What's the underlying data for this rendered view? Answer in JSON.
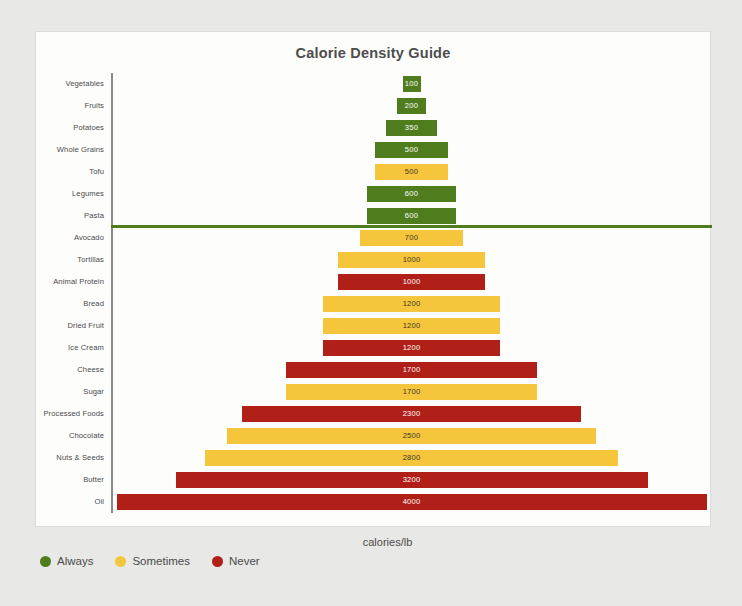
{
  "card": {
    "title": "Calorie Density Guide"
  },
  "legend": {
    "items": [
      {
        "label": "Always",
        "color": "#4f7d1e"
      },
      {
        "label": "Sometimes",
        "color": "#f5c63c"
      },
      {
        "label": "Never",
        "color": "#b01f18"
      }
    ]
  },
  "chart_data": {
    "type": "bar",
    "orientation": "horizontal-centered-funnel",
    "title": "Calorie Density Guide",
    "xlabel": "calories/lb",
    "ylabel": "",
    "xlim": [
      0,
      4000
    ],
    "grid": false,
    "legend_position": "bottom-left",
    "divider_after_category": "Pasta",
    "divider_color": "#4f7d1e",
    "categories": [
      "Vegetables",
      "Fruits",
      "Potatoes",
      "Whole Grains",
      "Tofu",
      "Legumes",
      "Pasta",
      "Avocado",
      "Tortillas",
      "Animal Protein",
      "Bread",
      "Dried Fruit",
      "Ice Cream",
      "Cheese",
      "Sugar",
      "Processed Foods",
      "Chocolate",
      "Nuts & Seeds",
      "Butter",
      "Oil"
    ],
    "values": [
      100,
      200,
      350,
      500,
      500,
      600,
      600,
      700,
      1000,
      1000,
      1200,
      1200,
      1200,
      1700,
      1700,
      2300,
      2500,
      2800,
      3200,
      4000
    ],
    "groups": [
      "Always",
      "Always",
      "Always",
      "Always",
      "Sometimes",
      "Always",
      "Always",
      "Sometimes",
      "Sometimes",
      "Never",
      "Sometimes",
      "Sometimes",
      "Never",
      "Never",
      "Sometimes",
      "Never",
      "Sometimes",
      "Sometimes",
      "Never",
      "Never"
    ],
    "colors": {
      "Always": "#4f7d1e",
      "Sometimes": "#f5c63c",
      "Never": "#b01f18"
    },
    "rows": [
      {
        "label": "Vegetables",
        "value": 100,
        "value_text": "100",
        "group": "Always"
      },
      {
        "label": "Fruits",
        "value": 200,
        "value_text": "200",
        "group": "Always"
      },
      {
        "label": "Potatoes",
        "value": 350,
        "value_text": "350",
        "group": "Always"
      },
      {
        "label": "Whole Grains",
        "value": 500,
        "value_text": "500",
        "group": "Always"
      },
      {
        "label": "Tofu",
        "value": 500,
        "value_text": "500",
        "group": "Sometimes"
      },
      {
        "label": "Legumes",
        "value": 600,
        "value_text": "600",
        "group": "Always"
      },
      {
        "label": "Pasta",
        "value": 600,
        "value_text": "600",
        "group": "Always"
      },
      {
        "label": "Avocado",
        "value": 700,
        "value_text": "700",
        "group": "Sometimes"
      },
      {
        "label": "Tortillas",
        "value": 1000,
        "value_text": "1000",
        "group": "Sometimes"
      },
      {
        "label": "Animal Protein",
        "value": 1000,
        "value_text": "1000",
        "group": "Never"
      },
      {
        "label": "Bread",
        "value": 1200,
        "value_text": "1200",
        "group": "Sometimes"
      },
      {
        "label": "Dried Fruit",
        "value": 1200,
        "value_text": "1200",
        "group": "Sometimes"
      },
      {
        "label": "Ice Cream",
        "value": 1200,
        "value_text": "1200",
        "group": "Never"
      },
      {
        "label": "Cheese",
        "value": 1700,
        "value_text": "1700",
        "group": "Never"
      },
      {
        "label": "Sugar",
        "value": 1700,
        "value_text": "1700",
        "group": "Sometimes"
      },
      {
        "label": "Processed Foods",
        "value": 2300,
        "value_text": "2300",
        "group": "Never"
      },
      {
        "label": "Chocolate",
        "value": 2500,
        "value_text": "2500",
        "group": "Sometimes"
      },
      {
        "label": "Nuts & Seeds",
        "value": 2800,
        "value_text": "2800",
        "group": "Sometimes"
      },
      {
        "label": "Butter",
        "value": 3200,
        "value_text": "3200",
        "group": "Never"
      },
      {
        "label": "Oil",
        "value": 4000,
        "value_text": "4000",
        "group": "Never"
      }
    ]
  },
  "axis": {
    "x_label": "calories/lb"
  }
}
